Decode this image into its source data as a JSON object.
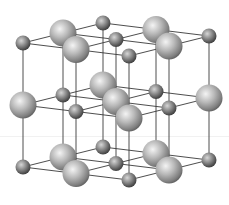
{
  "image": {
    "subject": "crystal lattice illustration",
    "description": "Rock-salt (NaCl-type) cubic lattice: 3x3x3 grid of alternating large and small spheres connected by thin lines",
    "lattice": {
      "type": "rock-salt",
      "grid_points_per_axis": 3,
      "sphere_kinds": [
        {
          "name": "large-ion",
          "relative_size": 1.0,
          "color": "#a8a8a8"
        },
        {
          "name": "small-ion",
          "relative_size": 0.55,
          "color": "#7a7a7a"
        }
      ],
      "corner_kind": "small-ion",
      "bond_color": "#3a3a3a",
      "background": "#ffffff"
    }
  }
}
